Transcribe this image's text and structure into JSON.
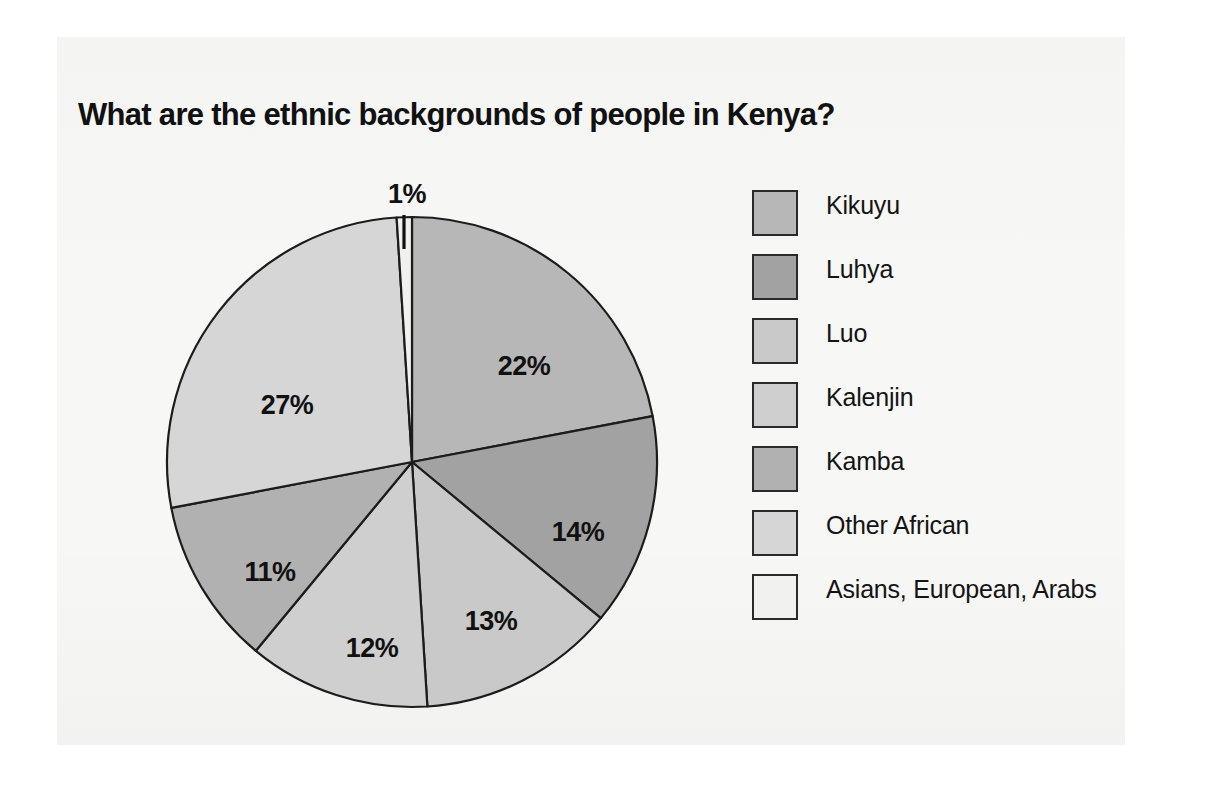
{
  "chart_data": {
    "type": "pie",
    "title": "What are the ethnic backgrounds of people in Kenya?",
    "categories": [
      "Kikuyu",
      "Luhya",
      "Luo",
      "Kalenjin",
      "Kamba",
      "Other African",
      "Asians, European, Arabs"
    ],
    "values": [
      22,
      14,
      13,
      12,
      11,
      27,
      1
    ],
    "value_labels": [
      "22%",
      "14%",
      "13%",
      "12%",
      "11%",
      "27%",
      "1%"
    ],
    "unit": "percent",
    "total": 100,
    "start_angle_deg": 0,
    "direction": "clockwise",
    "legend_position": "right",
    "grid": false,
    "xlabel": "",
    "ylabel": "",
    "colors": [
      "#b7b7b7",
      "#a2a2a2",
      "#c9c9c9",
      "#cfcfcf",
      "#b1b1b1",
      "#d6d6d6",
      "#f1f1ef"
    ],
    "slice_label_positions": [
      {
        "label": "22%",
        "x": 524,
        "y": 368
      },
      {
        "label": "14%",
        "x": 578,
        "y": 534
      },
      {
        "label": "13%",
        "x": 491,
        "y": 623
      },
      {
        "label": "12%",
        "x": 372,
        "y": 650
      },
      {
        "label": "11%",
        "x": 270,
        "y": 574
      },
      {
        "label": "27%",
        "x": 287,
        "y": 407
      },
      {
        "label": "1%",
        "x": 407,
        "y": 196
      }
    ],
    "annotations": [
      {
        "type": "leader-line",
        "for": "1%",
        "x1": 404,
        "y1": 215,
        "x2": 404,
        "y2": 249
      }
    ]
  },
  "legend": {
    "items": [
      {
        "label": "Kikuyu",
        "color": "#b7b7b7",
        "value": "22%"
      },
      {
        "label": "Luhya",
        "color": "#a2a2a2",
        "value": "14%"
      },
      {
        "label": "Luo",
        "color": "#c9c9c9",
        "value": "13%"
      },
      {
        "label": "Kalenjin",
        "color": "#cfcfcf",
        "value": "12%"
      },
      {
        "label": "Kamba",
        "color": "#b1b1b1",
        "value": "11%"
      },
      {
        "label": "Other African",
        "color": "#d6d6d6",
        "value": "27%"
      },
      {
        "label": "Asians, European, Arabs",
        "color": "#f1f1ef",
        "value": "1%"
      }
    ]
  },
  "page": {
    "background_color": "#ffffff",
    "surface_color": "#f7f7f5"
  }
}
